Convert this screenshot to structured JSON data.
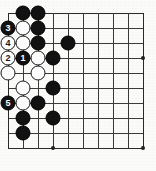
{
  "figure": {
    "kind": "go-board-diagram",
    "board": {
      "columns": 10,
      "rows": 10,
      "cell_size": 15,
      "origin_x": 8,
      "origin_y": 13,
      "line_color": "#3a3a3a",
      "background_color": "#fbfbfa"
    },
    "colors": {
      "black_stone": "#121212",
      "white_stone": "#fdfdfd",
      "black_label": "#ffffff",
      "white_label": "#1a1a1a",
      "star_point": "#222222"
    },
    "star_points": [
      {
        "col": 3,
        "row": 9
      },
      {
        "col": 9,
        "row": 9
      },
      {
        "col": 9,
        "row": 3
      }
    ],
    "stones": [
      {
        "col": 1,
        "row": 0,
        "color": "black",
        "label": ""
      },
      {
        "col": 2,
        "row": 0,
        "color": "black",
        "label": ""
      },
      {
        "col": 0,
        "row": 1,
        "color": "black",
        "label": "3"
      },
      {
        "col": 1,
        "row": 1,
        "color": "white",
        "label": ""
      },
      {
        "col": 2,
        "row": 1,
        "color": "black",
        "label": ""
      },
      {
        "col": 0,
        "row": 2,
        "color": "white",
        "label": "4"
      },
      {
        "col": 1,
        "row": 2,
        "color": "white",
        "label": ""
      },
      {
        "col": 2,
        "row": 2,
        "color": "black",
        "label": ""
      },
      {
        "col": 4,
        "row": 2,
        "color": "black",
        "label": ""
      },
      {
        "col": 0,
        "row": 3,
        "color": "white",
        "label": "2"
      },
      {
        "col": 1,
        "row": 3,
        "color": "black",
        "label": "1"
      },
      {
        "col": 2,
        "row": 3,
        "color": "white",
        "label": ""
      },
      {
        "col": 3,
        "row": 3,
        "color": "black",
        "label": ""
      },
      {
        "col": 0,
        "row": 4,
        "color": "white",
        "label": ""
      },
      {
        "col": 2,
        "row": 4,
        "color": "white",
        "label": ""
      },
      {
        "col": 1,
        "row": 5,
        "color": "white",
        "label": ""
      },
      {
        "col": 3,
        "row": 5,
        "color": "black",
        "label": ""
      },
      {
        "col": 0,
        "row": 6,
        "color": "black",
        "label": "5"
      },
      {
        "col": 1,
        "row": 6,
        "color": "white",
        "label": ""
      },
      {
        "col": 2,
        "row": 6,
        "color": "black",
        "label": ""
      },
      {
        "col": 1,
        "row": 7,
        "color": "black",
        "label": ""
      },
      {
        "col": 3,
        "row": 7,
        "color": "black",
        "label": ""
      },
      {
        "col": 1,
        "row": 8,
        "color": "black",
        "label": ""
      }
    ],
    "move_sequence": [
      {
        "number": "1",
        "color": "black"
      },
      {
        "number": "2",
        "color": "white"
      },
      {
        "number": "3",
        "color": "black"
      },
      {
        "number": "4",
        "color": "white"
      },
      {
        "number": "5",
        "color": "black"
      }
    ]
  }
}
